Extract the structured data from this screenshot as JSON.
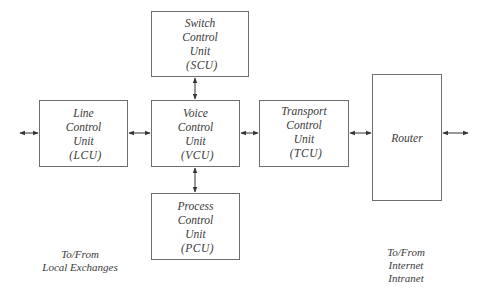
{
  "diagram": {
    "type": "block-diagram",
    "boxes": {
      "scu": {
        "lines": [
          "Switch",
          "Control",
          "Unit"
        ],
        "abbr": "(SCU)"
      },
      "lcu": {
        "lines": [
          "Line",
          "Control",
          "Unit"
        ],
        "abbr": "(LCU)"
      },
      "vcu": {
        "lines": [
          "Voice",
          "Control",
          "Unit"
        ],
        "abbr": "(VCU)"
      },
      "pcu": {
        "lines": [
          "Process",
          "Control",
          "Unit"
        ],
        "abbr": "(PCU)"
      },
      "tcu": {
        "lines": [
          "Transport",
          "Control",
          "Unit"
        ],
        "abbr": "(TCU)"
      },
      "router": {
        "lines": [
          "Router"
        ]
      }
    },
    "connections": [
      {
        "from": "external-left",
        "to": "lcu",
        "type": "bidirectional"
      },
      {
        "from": "lcu",
        "to": "vcu",
        "type": "bidirectional"
      },
      {
        "from": "scu",
        "to": "vcu",
        "type": "bidirectional"
      },
      {
        "from": "vcu",
        "to": "pcu",
        "type": "bidirectional"
      },
      {
        "from": "vcu",
        "to": "tcu",
        "type": "bidirectional"
      },
      {
        "from": "tcu",
        "to": "router",
        "type": "bidirectional"
      },
      {
        "from": "router",
        "to": "external-right",
        "type": "bidirectional"
      }
    ],
    "labels": {
      "left": [
        "To/From",
        "Local Exchanges"
      ],
      "right": [
        "To/From",
        "Internet",
        "Intranet"
      ]
    }
  }
}
